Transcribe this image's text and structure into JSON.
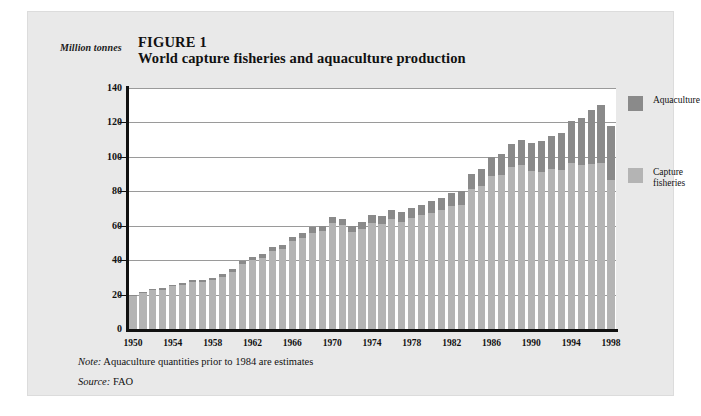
{
  "figure": {
    "unit_label": "Million tonnes",
    "number": "FIGURE 1",
    "title": "World capture fisheries and aquaculture production",
    "note_prefix": "Note:",
    "note_text": " Aquaculture quantities prior to 1984 are estimates",
    "source_prefix": "Source:",
    "source_text": " FAO"
  },
  "legend": {
    "position": "right",
    "items": [
      {
        "label": "Aquaculture",
        "color": "#8a8a8a"
      },
      {
        "label": "Capture\nfisheries",
        "color": "#b4b4b4"
      }
    ]
  },
  "chart_data": {
    "type": "bar",
    "stacked": true,
    "title": "World capture fisheries and aquaculture production",
    "xlabel": "",
    "ylabel": "Million tonnes",
    "ylim": [
      0,
      140
    ],
    "yticks": [
      0,
      20,
      40,
      60,
      80,
      100,
      120,
      140
    ],
    "grid": true,
    "grid_axis": "y",
    "legend_position": "right",
    "x_tick_labels": [
      "1950",
      "1954",
      "1958",
      "1962",
      "1966",
      "1970",
      "1974",
      "1978",
      "1982",
      "1986",
      "1990",
      "1994",
      "1998"
    ],
    "categories": [
      1950,
      1951,
      1952,
      1953,
      1954,
      1955,
      1956,
      1957,
      1958,
      1959,
      1960,
      1961,
      1962,
      1963,
      1964,
      1965,
      1966,
      1967,
      1968,
      1969,
      1970,
      1971,
      1972,
      1973,
      1974,
      1975,
      1976,
      1977,
      1978,
      1979,
      1980,
      1981,
      1982,
      1983,
      1984,
      1985,
      1986,
      1987,
      1988,
      1989,
      1990,
      1991,
      1992,
      1993,
      1994,
      1995,
      1996,
      1997,
      1998
    ],
    "series": [
      {
        "name": "Capture fisheries",
        "color": "#b4b4b4",
        "values": [
          19.3,
          21.0,
          22.5,
          22.7,
          24.7,
          25.7,
          27.2,
          27.3,
          28.2,
          30.2,
          33.3,
          37.5,
          40.1,
          41.4,
          45.2,
          46.2,
          51.0,
          53.0,
          56.0,
          56.8,
          61.5,
          60.2,
          56.1,
          58.0,
          61.6,
          60.8,
          63.8,
          62.2,
          64.3,
          66.0,
          67.6,
          69.0,
          71.4,
          72.1,
          81.1,
          83.0,
          88.8,
          89.2,
          94.0,
          95.0,
          92.0,
          91.4,
          92.8,
          92.6,
          96.6,
          95.0,
          96.0,
          96.6,
          86.3
        ]
      },
      {
        "name": "Aquaculture",
        "color": "#8a8a8a",
        "values": [
          0.6,
          0.7,
          0.8,
          0.9,
          1.0,
          1.1,
          1.2,
          1.3,
          1.5,
          1.6,
          1.7,
          1.8,
          2.0,
          2.1,
          2.3,
          2.4,
          2.6,
          2.8,
          3.0,
          3.2,
          3.5,
          3.7,
          3.9,
          4.2,
          4.5,
          4.8,
          5.1,
          5.5,
          5.9,
          6.3,
          6.7,
          7.2,
          7.7,
          8.2,
          9.0,
          10.0,
          11.3,
          12.4,
          13.6,
          14.8,
          16.3,
          17.6,
          19.1,
          21.4,
          24.4,
          27.8,
          31.1,
          33.6,
          31.5
        ]
      }
    ],
    "totals": [
      19.9,
      21.7,
      23.3,
      23.6,
      25.7,
      26.8,
      28.4,
      28.6,
      29.7,
      31.8,
      35.0,
      39.3,
      42.1,
      43.5,
      47.5,
      48.6,
      53.6,
      55.8,
      59.0,
      60.0,
      65.0,
      63.9,
      60.0,
      62.2,
      66.1,
      65.6,
      68.9,
      67.7,
      70.2,
      72.3,
      74.3,
      76.2,
      79.1,
      80.3,
      90.1,
      93.0,
      100.1,
      101.6,
      107.6,
      109.8,
      108.3,
      109.0,
      111.9,
      114.0,
      121.0,
      122.8,
      127.1,
      130.2,
      117.8
    ]
  }
}
